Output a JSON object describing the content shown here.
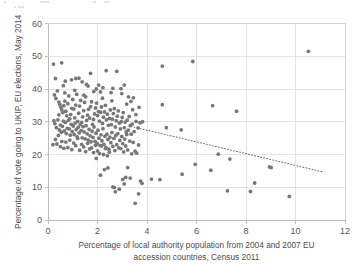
{
  "chart_data": {
    "type": "scatter",
    "title": "",
    "xlabel": "Percentage of local authority population from 2004 and 2007 EU accession countries, Census 2011",
    "xlabel_line1": "Percentage of local authority population from 2004 and 2007 EU",
    "xlabel_line2": "accession countries, Census 2011",
    "ylabel": "Percentage of vote going to UKIP, EU elections, May 2014",
    "xlim": [
      0,
      12
    ],
    "ylim": [
      0,
      60
    ],
    "xticks": [
      0,
      2,
      4,
      6,
      8,
      10,
      12
    ],
    "yticks": [
      0,
      10,
      20,
      30,
      40,
      50,
      60
    ],
    "xtick_labels": [
      "0",
      "2",
      "4",
      "6",
      "8",
      "10",
      "12"
    ],
    "ytick_labels": [
      "0",
      "10",
      "20",
      "30",
      "40",
      "50",
      "60"
    ],
    "grid": true,
    "grid_color": "#d9d9d9",
    "legend": null,
    "point_color": "#787878",
    "point_radius": 1.9,
    "trendline": {
      "type": "linear-dotted",
      "color": "#6f6f6f",
      "x_start": 3.35,
      "y_start": 28.6,
      "x_end": 11.1,
      "y_end": 14.7
    },
    "series": [
      {
        "name": "Local authorities",
        "points": [
          [
            0.22,
            47.6
          ],
          [
            0.55,
            48.0
          ],
          [
            0.3,
            43.2
          ],
          [
            0.62,
            41.0
          ],
          [
            0.7,
            42.4
          ],
          [
            0.95,
            42.8
          ],
          [
            1.12,
            43.2
          ],
          [
            1.25,
            43.3
          ],
          [
            1.38,
            42.2
          ],
          [
            1.55,
            41.4
          ],
          [
            1.72,
            44.8
          ],
          [
            1.62,
            40.9
          ],
          [
            1.95,
            40.0
          ],
          [
            2.05,
            41.2
          ],
          [
            2.12,
            39.1
          ],
          [
            2.22,
            40.4
          ],
          [
            2.35,
            45.6
          ],
          [
            2.55,
            38.9
          ],
          [
            2.62,
            40.2
          ],
          [
            2.78,
            45.4
          ],
          [
            2.95,
            40.1
          ],
          [
            3.08,
            41.2
          ],
          [
            3.25,
            37.6
          ],
          [
            3.35,
            36.2
          ],
          [
            3.45,
            37.3
          ],
          [
            4.62,
            47.0
          ],
          [
            5.85,
            48.4
          ],
          [
            10.52,
            51.5
          ],
          [
            0.26,
            38.2
          ],
          [
            0.32,
            37.1
          ],
          [
            0.38,
            39.4
          ],
          [
            0.44,
            36.0
          ],
          [
            0.48,
            35.2
          ],
          [
            0.52,
            34.4
          ],
          [
            0.56,
            33.6
          ],
          [
            0.6,
            32.8
          ],
          [
            0.64,
            34.9
          ],
          [
            0.68,
            36.3
          ],
          [
            0.72,
            33.2
          ],
          [
            0.76,
            31.8
          ],
          [
            0.8,
            35.5
          ],
          [
            0.84,
            37.9
          ],
          [
            0.88,
            30.9
          ],
          [
            0.92,
            32.2
          ],
          [
            0.96,
            34.1
          ],
          [
            1.0,
            36.8
          ],
          [
            1.04,
            33.9
          ],
          [
            1.08,
            31.2
          ],
          [
            1.12,
            35.1
          ],
          [
            1.16,
            38.4
          ],
          [
            1.2,
            30.1
          ],
          [
            1.24,
            32.6
          ],
          [
            1.28,
            34.8
          ],
          [
            1.32,
            36.5
          ],
          [
            1.36,
            29.8
          ],
          [
            1.4,
            31.5
          ],
          [
            1.44,
            33.4
          ],
          [
            1.48,
            35.9
          ],
          [
            1.52,
            37.6
          ],
          [
            1.56,
            30.4
          ],
          [
            1.6,
            32.0
          ],
          [
            1.64,
            33.8
          ],
          [
            1.68,
            31.1
          ],
          [
            1.72,
            34.6
          ],
          [
            1.76,
            36.1
          ],
          [
            1.8,
            29.2
          ],
          [
            1.84,
            30.7
          ],
          [
            1.88,
            32.4
          ],
          [
            1.92,
            34.2
          ],
          [
            1.96,
            35.7
          ],
          [
            2.0,
            31.9
          ],
          [
            2.04,
            33.1
          ],
          [
            2.08,
            30.2
          ],
          [
            2.12,
            32.9
          ],
          [
            2.16,
            34.5
          ],
          [
            2.2,
            29.5
          ],
          [
            2.24,
            31.4
          ],
          [
            2.28,
            33.0
          ],
          [
            2.32,
            35.0
          ],
          [
            2.36,
            30.6
          ],
          [
            2.4,
            32.3
          ],
          [
            2.44,
            28.9
          ],
          [
            2.48,
            31.0
          ],
          [
            2.52,
            33.6
          ],
          [
            2.56,
            29.1
          ],
          [
            2.6,
            30.8
          ],
          [
            2.64,
            32.5
          ],
          [
            2.68,
            34.0
          ],
          [
            2.72,
            28.4
          ],
          [
            2.76,
            30.3
          ],
          [
            2.8,
            31.7
          ],
          [
            2.84,
            33.3
          ],
          [
            2.88,
            29.6
          ],
          [
            2.92,
            27.8
          ],
          [
            2.96,
            30.0
          ],
          [
            3.0,
            31.3
          ],
          [
            3.04,
            32.8
          ],
          [
            3.08,
            28.2
          ],
          [
            3.12,
            29.9
          ],
          [
            3.16,
            26.9
          ],
          [
            3.2,
            30.5
          ],
          [
            3.24,
            27.4
          ],
          [
            3.28,
            31.6
          ],
          [
            3.32,
            28.8
          ],
          [
            3.36,
            26.2
          ],
          [
            3.4,
            29.3
          ],
          [
            3.48,
            27.0
          ],
          [
            3.56,
            30.1
          ],
          [
            3.64,
            28.1
          ],
          [
            3.72,
            29.7
          ],
          [
            3.82,
            30.0
          ],
          [
            0.28,
            29.4
          ],
          [
            0.34,
            28.2
          ],
          [
            0.4,
            30.6
          ],
          [
            0.46,
            27.5
          ],
          [
            0.5,
            29.0
          ],
          [
            0.54,
            26.8
          ],
          [
            0.58,
            28.6
          ],
          [
            0.62,
            30.2
          ],
          [
            0.66,
            27.2
          ],
          [
            0.7,
            29.8
          ],
          [
            0.74,
            26.4
          ],
          [
            0.78,
            28.0
          ],
          [
            0.82,
            30.4
          ],
          [
            0.86,
            27.8
          ],
          [
            0.9,
            25.9
          ],
          [
            0.94,
            29.2
          ],
          [
            0.98,
            27.0
          ],
          [
            1.02,
            28.7
          ],
          [
            1.06,
            26.1
          ],
          [
            1.1,
            29.6
          ],
          [
            1.14,
            27.6
          ],
          [
            1.18,
            25.4
          ],
          [
            1.22,
            28.3
          ],
          [
            1.26,
            26.6
          ],
          [
            1.3,
            29.1
          ],
          [
            1.34,
            27.3
          ],
          [
            1.38,
            25.1
          ],
          [
            1.42,
            28.5
          ],
          [
            1.46,
            26.9
          ],
          [
            1.5,
            24.8
          ],
          [
            1.54,
            28.8
          ],
          [
            1.58,
            26.3
          ],
          [
            1.62,
            24.4
          ],
          [
            1.66,
            27.7
          ],
          [
            1.7,
            25.7
          ],
          [
            1.74,
            23.9
          ],
          [
            1.78,
            27.1
          ],
          [
            1.82,
            25.2
          ],
          [
            1.86,
            28.4
          ],
          [
            1.9,
            24.0
          ],
          [
            1.94,
            26.5
          ],
          [
            1.98,
            23.4
          ],
          [
            2.02,
            27.4
          ],
          [
            2.06,
            25.0
          ],
          [
            2.1,
            22.8
          ],
          [
            2.14,
            26.0
          ],
          [
            2.18,
            24.2
          ],
          [
            2.22,
            27.9
          ],
          [
            2.26,
            23.1
          ],
          [
            2.3,
            25.6
          ],
          [
            2.34,
            22.2
          ],
          [
            2.38,
            26.2
          ],
          [
            2.42,
            24.6
          ],
          [
            2.46,
            21.6
          ],
          [
            2.5,
            25.3
          ],
          [
            2.54,
            23.6
          ],
          [
            2.58,
            26.7
          ],
          [
            2.62,
            22.5
          ],
          [
            2.66,
            24.9
          ],
          [
            2.7,
            21.2
          ],
          [
            2.74,
            25.8
          ],
          [
            2.78,
            23.0
          ],
          [
            2.82,
            26.4
          ],
          [
            2.86,
            22.0
          ],
          [
            2.9,
            24.3
          ],
          [
            2.94,
            21.8
          ],
          [
            2.98,
            25.5
          ],
          [
            3.02,
            23.3
          ],
          [
            3.06,
            20.8
          ],
          [
            3.1,
            24.7
          ],
          [
            3.14,
            22.6
          ],
          [
            3.18,
            26.1
          ],
          [
            3.22,
            21.4
          ],
          [
            3.3,
            24.1
          ],
          [
            3.38,
            20.2
          ],
          [
            3.44,
            23.7
          ],
          [
            3.52,
            21.0
          ],
          [
            3.58,
            20.4
          ],
          [
            3.66,
            22.9
          ],
          [
            0.3,
            24.6
          ],
          [
            0.36,
            23.2
          ],
          [
            0.42,
            25.8
          ],
          [
            0.5,
            22.4
          ],
          [
            0.56,
            24.0
          ],
          [
            0.64,
            21.9
          ],
          [
            0.72,
            23.8
          ],
          [
            0.8,
            22.1
          ],
          [
            0.88,
            24.4
          ],
          [
            0.96,
            21.5
          ],
          [
            1.04,
            23.5
          ],
          [
            1.12,
            22.7
          ],
          [
            1.2,
            24.9
          ],
          [
            1.28,
            21.3
          ],
          [
            1.36,
            23.1
          ],
          [
            1.44,
            22.3
          ],
          [
            1.52,
            20.9
          ],
          [
            1.6,
            23.4
          ],
          [
            1.68,
            21.7
          ],
          [
            1.76,
            22.0
          ],
          [
            1.84,
            20.6
          ],
          [
            1.92,
            22.8
          ],
          [
            2.0,
            21.1
          ],
          [
            2.08,
            20.3
          ],
          [
            2.16,
            22.6
          ],
          [
            2.24,
            20.0
          ],
          [
            2.32,
            21.8
          ],
          [
            2.4,
            19.6
          ],
          [
            2.48,
            20.7
          ],
          [
            0.2,
            23.0
          ],
          [
            0.24,
            30.3
          ],
          [
            0.44,
            32.1
          ],
          [
            0.68,
            38.8
          ],
          [
            1.08,
            39.6
          ],
          [
            1.45,
            38.1
          ],
          [
            1.85,
            39.2
          ],
          [
            2.2,
            37.2
          ],
          [
            2.58,
            36.4
          ],
          [
            2.98,
            38.6
          ],
          [
            3.18,
            35.4
          ],
          [
            3.42,
            33.7
          ],
          [
            3.55,
            32.2
          ],
          [
            3.68,
            34.4
          ],
          [
            1.95,
            18.8
          ],
          [
            2.28,
            15.4
          ],
          [
            2.42,
            15.9
          ],
          [
            2.12,
            13.7
          ],
          [
            2.68,
            9.9
          ],
          [
            2.72,
            8.6
          ],
          [
            2.62,
            10.1
          ],
          [
            2.88,
            9.4
          ],
          [
            3.02,
            12.4
          ],
          [
            3.08,
            11.0
          ],
          [
            3.14,
            13.0
          ],
          [
            3.22,
            16.0
          ],
          [
            3.32,
            12.8
          ],
          [
            3.52,
            5.1
          ],
          [
            3.66,
            8.0
          ],
          [
            3.74,
            11.9
          ],
          [
            3.8,
            11.2
          ],
          [
            4.18,
            12.5
          ],
          [
            4.52,
            12.3
          ],
          [
            4.62,
            35.2
          ],
          [
            4.78,
            28.2
          ],
          [
            5.38,
            27.5
          ],
          [
            5.42,
            14.0
          ],
          [
            5.95,
            17.0
          ],
          [
            6.58,
            15.2
          ],
          [
            6.65,
            34.9
          ],
          [
            6.88,
            20.1
          ],
          [
            7.25,
            8.9
          ],
          [
            7.35,
            18.6
          ],
          [
            7.62,
            33.2
          ],
          [
            8.18,
            8.7
          ],
          [
            8.35,
            11.3
          ],
          [
            8.95,
            16.2
          ],
          [
            9.02,
            16.0
          ],
          [
            9.75,
            7.2
          ]
        ]
      }
    ]
  },
  "axes": {
    "x_tick_labels": [
      "0",
      "2",
      "4",
      "6",
      "8",
      "10",
      "12"
    ],
    "y_tick_labels": [
      "0",
      "10",
      "20",
      "30",
      "40",
      "50",
      "60"
    ],
    "x_title_line1": "Percentage of local authority population from 2004 and 2007 EU",
    "x_title_line2": "accession countries, Census 2011",
    "y_title": "Percentage of vote going to UKIP, EU elections, May 2014"
  }
}
